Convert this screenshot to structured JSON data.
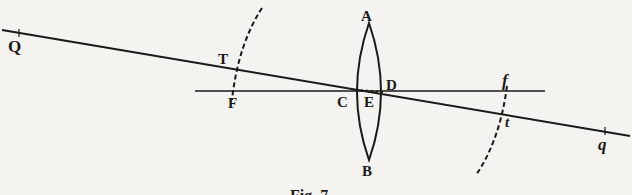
{
  "figure": {
    "caption": "Fig. 7",
    "labels": {
      "Q": "Q",
      "T": "T",
      "F": "F",
      "A": "A",
      "B": "B",
      "C": "C",
      "E": "E",
      "D": "D",
      "f": "f",
      "t": "t",
      "q": "q"
    },
    "colors": {
      "ink": "#1a1a1a",
      "paper": "#f4f3ef"
    }
  }
}
